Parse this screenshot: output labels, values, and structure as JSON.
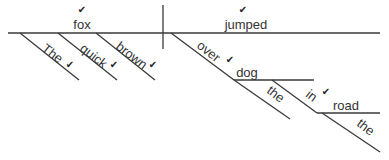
{
  "diagram": {
    "type": "Reed-Kellogg sentence diagram",
    "sentence_words": [
      "The",
      "quick",
      "brown",
      "fox",
      "jumped",
      "over",
      "the",
      "dog",
      "in",
      "the",
      "road"
    ],
    "colors": {
      "line": "#3a3a3a",
      "text": "#333333",
      "check": "#222222",
      "background": "#ffffff"
    },
    "check_glyph": "✔",
    "lines": [
      {
        "id": "baseline",
        "x1": 8,
        "y1": 33,
        "x2": 380,
        "y2": 33
      },
      {
        "id": "subject-predicate-divider",
        "x1": 163,
        "y1": 5,
        "x2": 163,
        "y2": 49
      },
      {
        "id": "modifier-the-1",
        "x1": 20,
        "y1": 33,
        "x2": 79,
        "y2": 80
      },
      {
        "id": "modifier-quick",
        "x1": 58,
        "y1": 33,
        "x2": 117,
        "y2": 80
      },
      {
        "id": "modifier-brown",
        "x1": 96,
        "y1": 33,
        "x2": 155,
        "y2": 80
      },
      {
        "id": "preposition-over",
        "x1": 171,
        "y1": 33,
        "x2": 234,
        "y2": 80
      },
      {
        "id": "object-dog-line",
        "x1": 234,
        "y1": 80,
        "x2": 314,
        "y2": 80
      },
      {
        "id": "modifier-the-2",
        "x1": 234,
        "y1": 80,
        "x2": 290,
        "y2": 119
      },
      {
        "id": "preposition-in",
        "x1": 272,
        "y1": 80,
        "x2": 317,
        "y2": 113
      },
      {
        "id": "object-road-line",
        "x1": 317,
        "y1": 113,
        "x2": 380,
        "y2": 113
      },
      {
        "id": "modifier-the-3",
        "x1": 322,
        "y1": 113,
        "x2": 380,
        "y2": 152
      }
    ],
    "labels": [
      {
        "id": "fox",
        "text": "fox",
        "role": "subject",
        "x": 82,
        "y": 29,
        "anchor": "middle",
        "rotate": 0,
        "check": {
          "x": 82,
          "y": 13
        }
      },
      {
        "id": "jumped",
        "text": "jumped",
        "role": "verb",
        "x": 246,
        "y": 29,
        "anchor": "middle",
        "rotate": 0,
        "check": {
          "x": 243,
          "y": 13
        }
      },
      {
        "id": "the-1",
        "text": "The",
        "role": "article",
        "x": 41,
        "y": 50,
        "anchor": "start",
        "rotate": 38,
        "check": {
          "x": 70,
          "y": 68
        }
      },
      {
        "id": "quick",
        "text": "quick",
        "role": "adjective",
        "x": 79,
        "y": 50,
        "anchor": "start",
        "rotate": 38,
        "check": {
          "x": 114,
          "y": 68
        }
      },
      {
        "id": "brown",
        "text": "brown",
        "role": "adjective",
        "x": 115,
        "y": 48,
        "anchor": "start",
        "rotate": 38,
        "check": {
          "x": 153,
          "y": 68
        }
      },
      {
        "id": "over",
        "text": "over",
        "role": "preposition",
        "x": 196,
        "y": 47,
        "anchor": "start",
        "rotate": 38,
        "check": {
          "x": 230,
          "y": 63
        }
      },
      {
        "id": "dog",
        "text": "dog",
        "role": "object",
        "x": 247,
        "y": 77,
        "anchor": "middle",
        "rotate": 0
      },
      {
        "id": "the-2",
        "text": "the",
        "role": "article",
        "x": 266,
        "y": 92,
        "anchor": "start",
        "rotate": 38
      },
      {
        "id": "in",
        "text": "in",
        "role": "preposition",
        "x": 305,
        "y": 96,
        "anchor": "start",
        "rotate": 38,
        "check": {
          "x": 326,
          "y": 95
        }
      },
      {
        "id": "road",
        "text": "road",
        "role": "object",
        "x": 346,
        "y": 110,
        "anchor": "middle",
        "rotate": 0
      },
      {
        "id": "the-3",
        "text": "the",
        "role": "article",
        "x": 356,
        "y": 125,
        "anchor": "start",
        "rotate": 38
      }
    ]
  }
}
